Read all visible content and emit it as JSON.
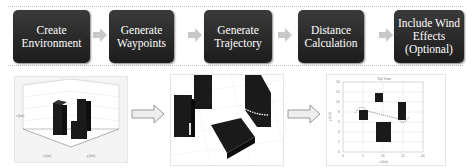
{
  "pipeline": {
    "steps": [
      {
        "label": "Create\nEnvironment"
      },
      {
        "label": "Generate\nWaypoints"
      },
      {
        "label": "Generate\nTrajectory"
      },
      {
        "label": "Distance\nCalculation"
      },
      {
        "label": "Include Wind\nEffects\n(Optional)"
      }
    ],
    "step_color": "#222222",
    "chevron_color": "#c8c8c8"
  },
  "figures": {
    "env3d": {
      "type": "3d-environment-plot"
    },
    "traj3d": {
      "type": "3d-trajectory-plot"
    },
    "topview": {
      "title": "Top View",
      "xlabel": "x (km)",
      "ylabel": "y (km)",
      "xticks": [
        "0",
        "5",
        "10",
        "15",
        "20"
      ],
      "yticks": [
        "0",
        "2",
        "4",
        "6",
        "8",
        "10",
        "12",
        "14"
      ]
    }
  }
}
